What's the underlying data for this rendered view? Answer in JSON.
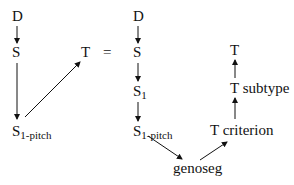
{
  "diagram": {
    "left": {
      "nodes": {
        "d": {
          "main": "D"
        },
        "s": {
          "main": "S"
        },
        "s1pitch": {
          "main": "S",
          "sub": "1-pitch"
        },
        "t": {
          "main": "T"
        }
      },
      "edges": [
        [
          "D",
          "S"
        ],
        [
          "S",
          "S1-pitch"
        ],
        [
          "S1-pitch",
          "T"
        ]
      ]
    },
    "equals": "=",
    "right": {
      "nodes": {
        "d": {
          "main": "D"
        },
        "s": {
          "main": "S"
        },
        "s1": {
          "main": "S",
          "sub": "1"
        },
        "s1pitch": {
          "main": "S",
          "sub": "1-pitch"
        },
        "genoseg": {
          "main": "genoseg"
        },
        "tcriterion": {
          "main": "T criterion"
        },
        "tsubtype": {
          "main": "T subtype"
        },
        "t": {
          "main": "T"
        }
      },
      "edges": [
        [
          "D",
          "S"
        ],
        [
          "S",
          "S1"
        ],
        [
          "S1",
          "S1-pitch"
        ],
        [
          "S1-pitch",
          "genoseg"
        ],
        [
          "genoseg",
          "T criterion"
        ],
        [
          "T criterion",
          "T subtype"
        ],
        [
          "T subtype",
          "T"
        ]
      ]
    }
  }
}
